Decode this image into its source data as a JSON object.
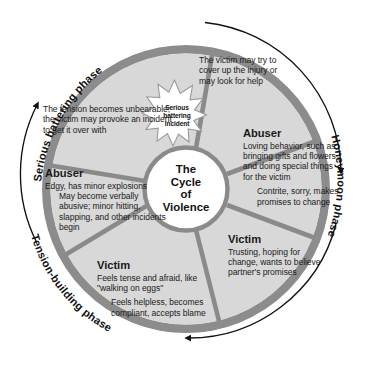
{
  "diagram": {
    "title_center": [
      "The",
      "Cycle",
      "of",
      "Violence"
    ],
    "center_text": "The Cycle of Violence",
    "starburst": {
      "lines": [
        "Serious",
        "battering",
        "incident"
      ],
      "text": "Serious battering incident",
      "icon": "starburst-icon"
    },
    "phases": [
      {
        "id": "serious-battering",
        "label": "Serious battering phase"
      },
      {
        "id": "honeymoon",
        "label": "Honeymoon phase"
      },
      {
        "id": "tension-building",
        "label": "Tension-building phase"
      }
    ],
    "segments": [
      {
        "id": "tension-climax",
        "heading": "",
        "primary": "The tension becomes unbearable; the victim may provoke an incident to get it over with",
        "secondary": ""
      },
      {
        "id": "battering-victim",
        "heading": "",
        "primary": "The victim may try to cover up the injury or may look for  help",
        "secondary": ""
      },
      {
        "id": "honeymoon-abuser",
        "heading": "Abuser",
        "primary": "Loving behavior, such as bringing gifts and flowers and doing special things for the victim",
        "secondary": "Contrite, sorry, makes promises to change"
      },
      {
        "id": "honeymoon-victim",
        "heading": "Victim",
        "primary": "Trusting, hoping for change, wants to believe partner's promises",
        "secondary": ""
      },
      {
        "id": "tension-victim",
        "heading": "Victim",
        "primary": "Feels tense and afraid, like \"walking on eggs\"",
        "secondary": "Feels helpless, becomes compliant, accepts blame"
      },
      {
        "id": "tension-abuser",
        "heading": "Abuser",
        "primary": "Edgy, has minor explosions",
        "secondary": "May become verbally abusive; minor hitting, slapping, and other incidents begin"
      }
    ],
    "colors": {
      "ring": "#8c8c8c",
      "ring_dark": "#6e6e6e",
      "segment_fill": "#d6d6d6",
      "segment_fill_alt": "#dcdcdc",
      "divider": "#8a8a8a",
      "center_fill": "#ffffff",
      "star_fill": "#ffffff",
      "arrow": "#111111",
      "text": "#1a1a1a",
      "page": "#ffffff"
    }
  }
}
